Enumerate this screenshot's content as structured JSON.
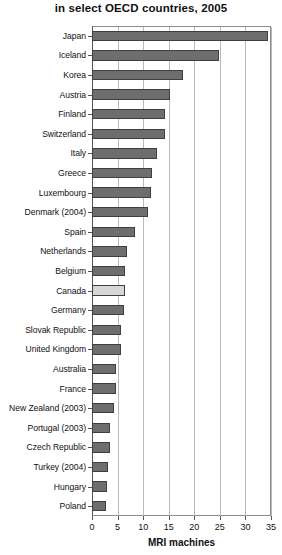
{
  "chart_data": {
    "type": "bar",
    "orientation": "horizontal",
    "title": "in select OECD countries, 2005",
    "xlabel": "MRI machines",
    "ylabel": "",
    "xlim": [
      0,
      35
    ],
    "xticks": [
      0,
      5,
      10,
      15,
      20,
      25,
      30,
      35
    ],
    "grid": "vertical",
    "legend": null,
    "highlight_category": "Canada",
    "colors": {
      "bar": "#6e6e6e",
      "bar_border": "#3f3f3f",
      "highlight_bar": "#d6d6d6",
      "gridline": "#b9b9b9",
      "axis": "#555555",
      "text": "#111111",
      "background": "#ffffff"
    },
    "categories": [
      "Japan",
      "Iceland",
      "Korea",
      "Austria",
      "Finland",
      "Switzerland",
      "Italy",
      "Greece",
      "Luxembourg",
      "Denmark (2004)",
      "Spain",
      "Netherlands",
      "Belgium",
      "Canada",
      "Germany",
      "Slovak Republic",
      "United Kingdom",
      "Australia",
      "France",
      "New Zealand (2003)",
      "Portugal (2003)",
      "Czech Republic",
      "Turkey (2004)",
      "Hungary",
      "Poland"
    ],
    "values": [
      34.5,
      24.8,
      17.8,
      15.3,
      14.3,
      14.3,
      12.7,
      11.7,
      11.6,
      11.0,
      8.4,
      6.8,
      6.5,
      6.5,
      6.2,
      5.7,
      5.6,
      4.7,
      4.6,
      4.3,
      3.6,
      3.5,
      3.2,
      2.9,
      2.7
    ]
  }
}
